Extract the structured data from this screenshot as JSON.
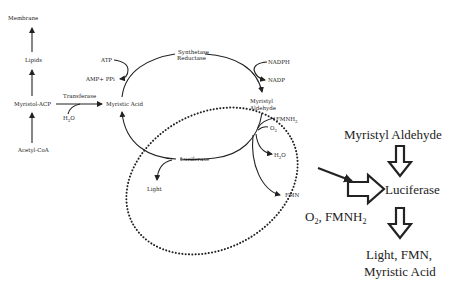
{
  "diagram": {
    "left_pathway": {
      "nodes": [
        "Membrane",
        "Lipids",
        "Myristol-ACP",
        "Acetyl-CoA"
      ],
      "transferase_label": "Transferase",
      "water": "H2O"
    },
    "cycle": {
      "myristic_acid": "Myristic  Acid",
      "atp": "ATP",
      "amp_ppi": "AMP+ PPi",
      "synthetase": "Synthetase",
      "reductase": "Reductase",
      "nadph": "NADPH",
      "nadp": "NADP",
      "myristyl": "Myristyl",
      "aldehyde": "Aldehyde",
      "fmnh2": "FMNH2",
      "o2": "O2",
      "h2o": "H2O",
      "fmn": "FMN",
      "luciferase": "Luciferase",
      "light": "Light"
    },
    "summary": {
      "substrate": "Myristyl Aldehyde",
      "enzyme": "Luciferase",
      "cofactors": "O2, FMNH2",
      "products_line1": "Light, FMN,",
      "products_line2": "Myristic Acid"
    },
    "colors": {
      "ink": "#222222",
      "background": "#ffffff"
    }
  }
}
